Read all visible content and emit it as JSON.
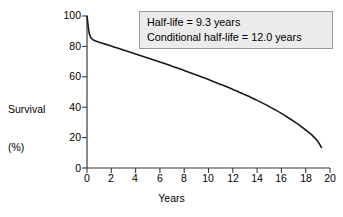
{
  "figure": {
    "name": "survival-curve-figure",
    "background": "#ffffff",
    "line_color": "#1a1a1a",
    "axis_color": "#3a3a3a",
    "annotation_fill": "#ebebeb",
    "annotation_border": "#9a9a9a"
  },
  "annotation": {
    "lines": [
      "Half-life = 9.3 years",
      "Conditional half-life = 12.0 years"
    ],
    "line1": "Half-life = 9.3 years",
    "line2": "Conditional half-life = 12.0 years"
  },
  "ylabel": {
    "line1": "Survival",
    "line2": "(%)"
  },
  "xlabel": {
    "text": "Years"
  },
  "yticks": [
    "0",
    "20",
    "40",
    "60",
    "80",
    "100"
  ],
  "xticks": [
    "0",
    "2",
    "4",
    "6",
    "8",
    "10",
    "12",
    "14",
    "16",
    "18",
    "20"
  ],
  "chart_data": {
    "type": "line",
    "title": "",
    "subtitle": "",
    "xlabel": "Years",
    "ylabel": "Survival (%)",
    "xlim": [
      0,
      20
    ],
    "ylim": [
      0,
      100
    ],
    "xticks": [
      0,
      2,
      4,
      6,
      8,
      10,
      12,
      14,
      16,
      18,
      20
    ],
    "yticks": [
      0,
      20,
      40,
      60,
      80,
      100
    ],
    "grid": false,
    "legend": false,
    "legend_position": "none",
    "annotations": [
      {
        "text": "Half-life = 9.3 years",
        "x": 5.6,
        "y": 96
      },
      {
        "text": "Conditional half-life = 12.0 years",
        "x": 5.6,
        "y": 89
      }
    ],
    "series": [
      {
        "name": "Survival",
        "color": "#1a1a1a",
        "x": [
          0.0,
          0.05,
          0.1,
          0.15,
          0.2,
          0.3,
          0.4,
          0.5,
          0.7,
          1.0,
          1.5,
          2.0,
          2.5,
          3.0,
          3.5,
          4.0,
          4.5,
          5.0,
          5.5,
          6.0,
          6.5,
          7.0,
          7.5,
          8.0,
          8.5,
          9.0,
          9.3,
          9.5,
          10.0,
          10.5,
          11.0,
          11.5,
          12.0,
          12.5,
          13.0,
          13.5,
          14.0,
          14.5,
          15.0,
          15.5,
          16.0,
          16.5,
          17.0,
          17.5,
          18.0,
          18.5,
          19.0,
          19.3
        ],
        "y": [
          100.0,
          96.5,
          93.0,
          90.2,
          88.2,
          86.0,
          85.0,
          84.4,
          83.6,
          82.8,
          81.5,
          80.2,
          78.9,
          77.6,
          76.3,
          75.0,
          73.7,
          72.4,
          71.1,
          69.8,
          68.4,
          67.0,
          65.6,
          64.2,
          62.7,
          61.2,
          60.3,
          59.7,
          58.2,
          56.6,
          55.0,
          53.4,
          51.7,
          50.0,
          48.2,
          46.4,
          44.5,
          42.5,
          40.4,
          38.2,
          35.9,
          33.4,
          30.8,
          28.0,
          25.0,
          21.8,
          17.5,
          13.5
        ]
      }
    ]
  }
}
